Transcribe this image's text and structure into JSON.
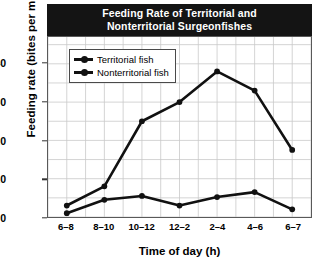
{
  "chart_data": {
    "type": "line",
    "title": "Feeding Rate of Territorial and Nonterritorial Surgeonfishes",
    "title_line1": "Feeding Rate of Territorial and",
    "title_line2": "Nonterritorial Surgeonfishes",
    "xlabel": "Time of day (h)",
    "ylabel": "Feeding rate (bites per min)",
    "categories": [
      "6–8",
      "8–10",
      "10–12",
      "12–2",
      "2–4",
      "4–6",
      "6–7"
    ],
    "yticks": [
      0,
      10,
      20,
      30,
      40
    ],
    "ylim": [
      0,
      47
    ],
    "grid": true,
    "legend_position": "top-left-inside",
    "series": [
      {
        "name": "Territorial fish",
        "values": [
          1,
          4.5,
          5.5,
          3,
          5.2,
          6.5,
          2
        ],
        "color": "#111111",
        "marker": "circle"
      },
      {
        "name": "Nonterritorial fish",
        "values": [
          3,
          8,
          25,
          30,
          38,
          33,
          17.5
        ],
        "color": "#111111",
        "marker": "circle"
      }
    ]
  },
  "caption": ""
}
